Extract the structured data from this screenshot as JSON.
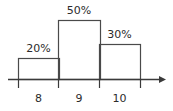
{
  "chart_data": {
    "type": "bar",
    "title": "",
    "subtitle": "",
    "xlabel": "",
    "ylabel": "",
    "categories": [
      "8",
      "9",
      "10"
    ],
    "values": [
      20,
      50,
      30
    ],
    "value_labels": [
      "20%",
      "50%",
      "30%"
    ],
    "tick_labels": [
      "8",
      "9",
      "10"
    ],
    "ylim": [
      0,
      60
    ],
    "grid": false,
    "legend": "none",
    "axis_arrow": true,
    "orientation": "vertical"
  },
  "style": {
    "background_color": "#ffffff",
    "line_color": "#3a3a3a",
    "bar_outline_color": "#4a4a4a",
    "bar_fill_color": "#ffffff",
    "text_color": "#2b2b2b"
  },
  "bars": [
    {
      "label": "20%",
      "category": "8",
      "value": 20,
      "x": 18,
      "width": 41,
      "top": 58
    },
    {
      "label": "50%",
      "category": "9",
      "value": 50,
      "x": 58,
      "width": 42,
      "top": 20
    },
    {
      "label": "30%",
      "category": "10",
      "value": 30,
      "x": 99,
      "width": 41,
      "top": 44
    }
  ],
  "axis": {
    "baseline_y": 79,
    "start_x": 8,
    "end_x": 166,
    "tick_positions": [
      18,
      58,
      99,
      140
    ],
    "tick_length": 9
  }
}
